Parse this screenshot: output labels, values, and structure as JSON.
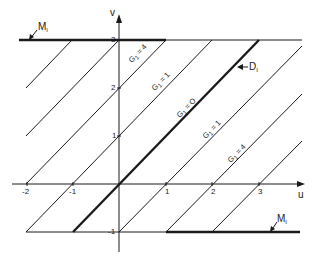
{
  "diagram": {
    "axes": {
      "x_label": "u",
      "y_label": "v",
      "x_ticks": [
        "-2",
        "-1",
        "1",
        "2",
        "3"
      ],
      "y_ticks": [
        "3",
        "2",
        "1",
        "-1"
      ]
    },
    "lines": [
      {
        "name": "G1",
        "value": "4",
        "label": "G",
        "sub": "1",
        "eq": " = 4"
      },
      {
        "name": "G1",
        "value": "1",
        "label": "G",
        "sub": "1",
        "eq": " = 1"
      },
      {
        "name": "G1",
        "value": "0",
        "label": "G",
        "sub": "1",
        "eq": " = O"
      },
      {
        "name": "G1",
        "value": "1",
        "label": "G",
        "sub": "1",
        "eq": " = 1"
      },
      {
        "name": "G1",
        "value": "4",
        "label": "G",
        "sub": "1",
        "eq": " = 4"
      }
    ],
    "annotations": {
      "m1_top": {
        "label": "M",
        "sub": "I"
      },
      "m1_bottom": {
        "label": "M",
        "sub": "I"
      },
      "d1": {
        "label": "D",
        "sub": "I"
      }
    },
    "colors": {
      "ink": "#1a1a1a",
      "background": "#ffffff"
    }
  }
}
